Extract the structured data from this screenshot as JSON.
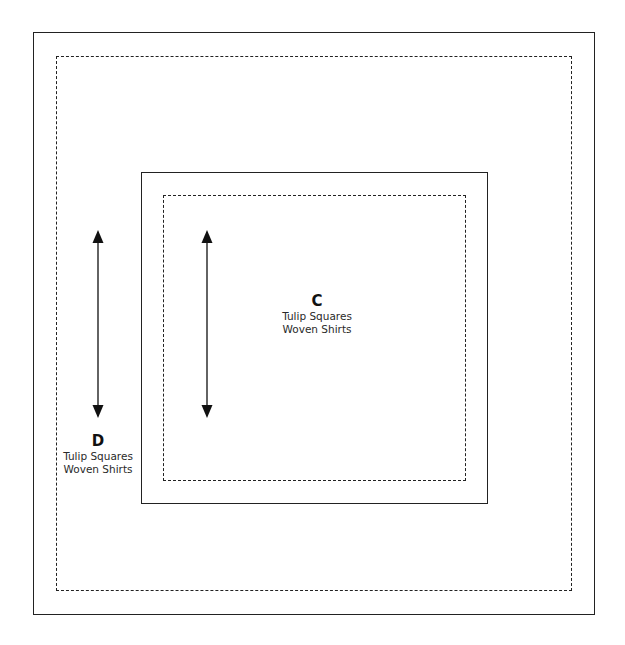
{
  "diagram": {
    "type": "quilt-layout",
    "blocks": [
      {
        "id": "D",
        "letter": "D",
        "lines": [
          "Tulip Squares",
          "Woven Shirts"
        ],
        "outer_border": "solid",
        "inner_border": "dashed",
        "arrow": "vertical-double"
      },
      {
        "id": "C",
        "letter": "C",
        "lines": [
          "Tulip Squares",
          "Woven Shirts"
        ],
        "outer_border": "solid",
        "inner_border": "dashed",
        "arrow": "vertical-double"
      }
    ],
    "colors": {
      "line": "#222222",
      "background": "#ffffff"
    }
  }
}
